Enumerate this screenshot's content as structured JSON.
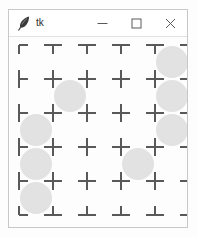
{
  "window": {
    "title": "tk",
    "icon": "tk-feather-icon",
    "width": 180,
    "height": 219,
    "controls": [
      {
        "name": "minimize-button",
        "label": "—",
        "icon": "minimize-icon"
      },
      {
        "name": "maximize-button",
        "label": "□",
        "icon": "maximize-icon"
      },
      {
        "name": "close-button",
        "label": "✕",
        "icon": "close-icon"
      }
    ]
  },
  "colors": {
    "window_background": "#ffffff",
    "window_border": "#c8c8c8",
    "canvas_background": "#fdfdfd",
    "grid_tick": "#595959",
    "circle_fill": "#e2e2e2",
    "title_text": "#2b2b2b",
    "control_glyph": "#5a5a5a"
  },
  "canvas": {
    "name": "grid-canvas",
    "cols": 5,
    "rows": 5,
    "cell_size": 34,
    "origin_x": 10,
    "origin_y": 8,
    "tick_length": 9,
    "tick_width": 2,
    "circle_radius": 16,
    "circles": [
      {
        "row": 0,
        "col": 4
      },
      {
        "row": 1,
        "col": 1
      },
      {
        "row": 1,
        "col": 4
      },
      {
        "row": 2,
        "col": 0
      },
      {
        "row": 2,
        "col": 4
      },
      {
        "row": 3,
        "col": 0
      },
      {
        "row": 3,
        "col": 3
      },
      {
        "row": 4,
        "col": 0
      }
    ],
    "circle_count": 8
  }
}
